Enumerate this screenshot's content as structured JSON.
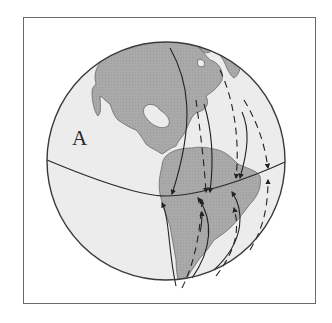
{
  "figure": {
    "type": "globe-diagram",
    "label": "A",
    "colors": {
      "frame": "#6a6a6a",
      "globe_outline": "#3a3a3a",
      "ocean": "#ececec",
      "land": "#a9a9a9",
      "arrows": "#222222",
      "background": "#ffffff"
    },
    "elements": {
      "equator_line": "equator",
      "continents": [
        "North America",
        "South America",
        "Greenland (partial)"
      ],
      "solid_arrows_north": 3,
      "solid_arrows_south": 4,
      "dashed_arrows_north": 3,
      "dashed_arrows_south": 3
    }
  }
}
